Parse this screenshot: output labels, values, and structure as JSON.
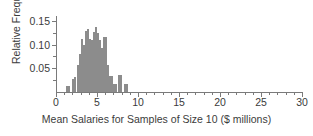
{
  "chart_data": {
    "type": "bar",
    "title": "",
    "subtitle": "",
    "xlabel": "Mean Salaries for Samples of Size 10 ($ millions)",
    "ylabel": "Relative Frequency",
    "xlim": [
      0,
      30
    ],
    "ylim": [
      0,
      0.16
    ],
    "grid": false,
    "legend": null,
    "bin_width": 0.25,
    "x_major_ticks": [
      0,
      5,
      10,
      15,
      20,
      25,
      30
    ],
    "x_tick_labels": [
      "0",
      "5",
      "10",
      "15",
      "20",
      "25",
      "30"
    ],
    "x_minor_tick_step": 1,
    "y_major_ticks": [
      0.05,
      0.1,
      0.15
    ],
    "y_tick_labels": [
      "0.05",
      "0.10",
      "0.15"
    ],
    "y_minor_tick_step": 0.025,
    "bin_left_edges": [
      1.25,
      1.5,
      1.75,
      2.0,
      2.25,
      2.5,
      2.75,
      3.0,
      3.25,
      3.5,
      3.75,
      4.0,
      4.25,
      4.5,
      4.75,
      5.0,
      5.25,
      5.5,
      5.75,
      6.0,
      6.25,
      6.5,
      6.75,
      7.0,
      7.25,
      7.5,
      7.75,
      8.0,
      8.25,
      8.5
    ],
    "categories": [
      "1.25",
      "1.50",
      "1.75",
      "2.00",
      "2.25",
      "2.50",
      "2.75",
      "3.00",
      "3.25",
      "3.50",
      "3.75",
      "4.00",
      "4.25",
      "4.50",
      "4.75",
      "5.00",
      "5.25",
      "5.50",
      "5.75",
      "6.00",
      "6.25",
      "6.50",
      "6.75",
      "7.00",
      "7.25",
      "7.50",
      "7.75",
      "8.00",
      "8.25",
      "8.50"
    ],
    "values": [
      0.012,
      0.012,
      0.0,
      0.027,
      0.031,
      0.057,
      0.079,
      0.112,
      0.1,
      0.128,
      0.133,
      0.112,
      0.11,
      0.126,
      0.136,
      0.124,
      0.11,
      0.092,
      0.115,
      0.116,
      0.056,
      0.034,
      0.034,
      0.017,
      0.017,
      0.036,
      0.036,
      0.0,
      0.016,
      0.016
    ]
  },
  "axes": {
    "y_title": "Relative Frequency",
    "x_title": "Mean Salaries for Samples of Size 10 ($ millions)"
  }
}
